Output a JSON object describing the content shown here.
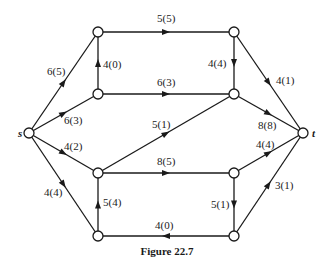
{
  "figure": {
    "caption": "Figure 22.7",
    "line_color": "#1a1a1a",
    "node_fill": "#ffffff"
  },
  "nodes": [
    {
      "id": "s",
      "label": "s",
      "x": 29,
      "y": 133
    },
    {
      "id": "a",
      "label": "",
      "x": 98,
      "y": 32
    },
    {
      "id": "b",
      "label": "",
      "x": 234,
      "y": 32
    },
    {
      "id": "c",
      "label": "",
      "x": 98,
      "y": 94
    },
    {
      "id": "d",
      "label": "",
      "x": 234,
      "y": 94
    },
    {
      "id": "e",
      "label": "",
      "x": 98,
      "y": 173
    },
    {
      "id": "f",
      "label": "",
      "x": 234,
      "y": 173
    },
    {
      "id": "g",
      "label": "",
      "x": 98,
      "y": 236
    },
    {
      "id": "h",
      "label": "",
      "x": 234,
      "y": 236
    },
    {
      "id": "t",
      "label": "t",
      "x": 303,
      "y": 133
    }
  ],
  "edges": [
    {
      "from": "s",
      "to": "a",
      "capacity": 6,
      "flow": 5,
      "label": "6(5)",
      "lx": 47,
      "ly": 75
    },
    {
      "from": "s",
      "to": "c",
      "capacity": 6,
      "flow": 3,
      "label": "6(3)",
      "lx": 64,
      "ly": 124
    },
    {
      "from": "s",
      "to": "e",
      "capacity": 4,
      "flow": 2,
      "label": "4(2)",
      "lx": 64,
      "ly": 150
    },
    {
      "from": "s",
      "to": "g",
      "capacity": 4,
      "flow": 4,
      "label": "4(4)",
      "lx": 44,
      "ly": 196
    },
    {
      "from": "c",
      "to": "a",
      "capacity": 4,
      "flow": 0,
      "label": "4(0)",
      "lx": 103,
      "ly": 68
    },
    {
      "from": "a",
      "to": "b",
      "capacity": 5,
      "flow": 5,
      "label": "5(5)",
      "lx": 157,
      "ly": 22
    },
    {
      "from": "b",
      "to": "d",
      "capacity": 4,
      "flow": 4,
      "label": "4(4)",
      "lx": 208,
      "ly": 67
    },
    {
      "from": "c",
      "to": "d",
      "capacity": 6,
      "flow": 3,
      "label": "6(3)",
      "lx": 157,
      "ly": 86
    },
    {
      "from": "b",
      "to": "t",
      "capacity": 4,
      "flow": 1,
      "label": "4(1)",
      "lx": 276,
      "ly": 84
    },
    {
      "from": "d",
      "to": "t",
      "capacity": 8,
      "flow": 8,
      "label": "8(8)",
      "lx": 258,
      "ly": 129
    },
    {
      "from": "e",
      "to": "d",
      "capacity": 5,
      "flow": 1,
      "label": "5(1)",
      "lx": 152,
      "ly": 128
    },
    {
      "from": "e",
      "to": "f",
      "capacity": 8,
      "flow": 5,
      "label": "8(5)",
      "lx": 157,
      "ly": 165
    },
    {
      "from": "f",
      "to": "t",
      "capacity": 4,
      "flow": 4,
      "label": "4(4)",
      "lx": 256,
      "ly": 148
    },
    {
      "from": "g",
      "to": "e",
      "capacity": 5,
      "flow": 4,
      "label": "5(4)",
      "lx": 103,
      "ly": 206
    },
    {
      "from": "f",
      "to": "h",
      "capacity": 5,
      "flow": 1,
      "label": "5(1)",
      "lx": 211,
      "ly": 208
    },
    {
      "from": "h",
      "to": "g",
      "capacity": 4,
      "flow": 0,
      "label": "4(0)",
      "lx": 155,
      "ly": 229
    },
    {
      "from": "h",
      "to": "t",
      "capacity": 3,
      "flow": 1,
      "label": "3(1)",
      "lx": 275,
      "ly": 189
    }
  ]
}
